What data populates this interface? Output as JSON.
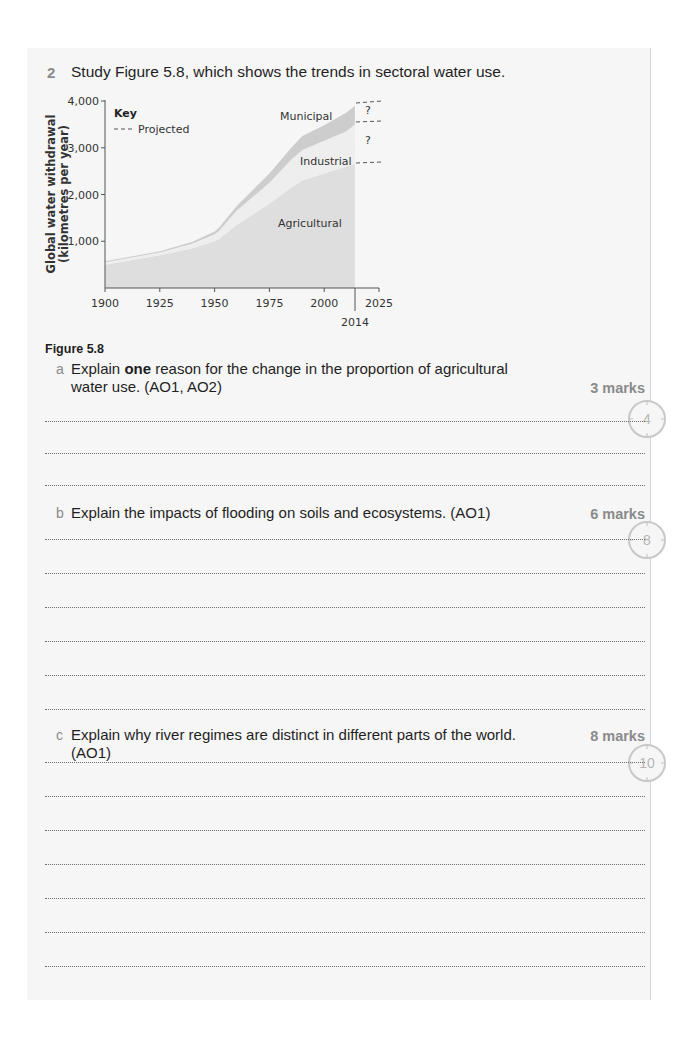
{
  "question": {
    "number": "2",
    "stem": "Study Figure 5.8, which shows the trends in sectoral water use.",
    "figure_caption": "Figure 5.8"
  },
  "chart_data": {
    "type": "area",
    "title": "",
    "xlabel": "",
    "ylabel": "Global water withdrawal (kilometres per year)",
    "ylabel_line1": "Global water withdrawal",
    "ylabel_line2": "(kilometres per year)",
    "x": [
      1900,
      1925,
      1940,
      1950,
      1952,
      1960,
      1975,
      1985,
      1990,
      2000,
      2010,
      2014
    ],
    "x_ticks": [
      "1900",
      "1925",
      "1950",
      "1975",
      "2000",
      "2025"
    ],
    "x_extra_marker": "2014",
    "y_ticks": [
      "1,000",
      "2,000",
      "3,000",
      "4,000"
    ],
    "ylim": [
      0,
      4000
    ],
    "xlim": [
      1900,
      2025
    ],
    "grid": false,
    "stacking": "stacked",
    "series": [
      {
        "name": "Agricultural",
        "values": [
          500,
          700,
          850,
          1000,
          1050,
          1350,
          1800,
          2150,
          2300,
          2450,
          2600,
          2650
        ]
      },
      {
        "name": "Industrial",
        "values": [
          50,
          60,
          100,
          150,
          170,
          300,
          450,
          600,
          650,
          700,
          750,
          850
        ]
      },
      {
        "name": "Municipal",
        "values": [
          20,
          25,
          40,
          60,
          70,
          100,
          200,
          250,
          300,
          330,
          400,
          400
        ]
      }
    ],
    "projection": {
      "from": 2014,
      "to": 2025,
      "label": "?",
      "style": "dashed"
    },
    "legend": {
      "title": "Key",
      "items": [
        {
          "label": "Projected",
          "style": "dashed"
        }
      ],
      "position": "top-left"
    },
    "annotations": [
      "Municipal",
      "Industrial",
      "Agricultural",
      "?",
      "?"
    ],
    "colors": {
      "agricultural": "#dedede",
      "industrial": "#eeeeee",
      "municipal": "#cdcdcd"
    }
  },
  "parts": [
    {
      "letter": "a",
      "text_before": "Explain ",
      "text_bold": "one",
      "text_after": " reason for the change in the proportion of agricultural water use. (AO1, AO2)",
      "marks": "3 marks",
      "timer_minutes": "4",
      "answer_lines": 3
    },
    {
      "letter": "b",
      "text": "Explain the impacts of flooding on soils and ecosystems. (AO1)",
      "marks": "6 marks",
      "timer_minutes": "8",
      "answer_lines": 6
    },
    {
      "letter": "c",
      "text": "Explain why river regimes are distinct in different parts of the world. (AO1)",
      "marks": "8 marks",
      "timer_minutes": "10",
      "answer_lines": 8
    }
  ]
}
